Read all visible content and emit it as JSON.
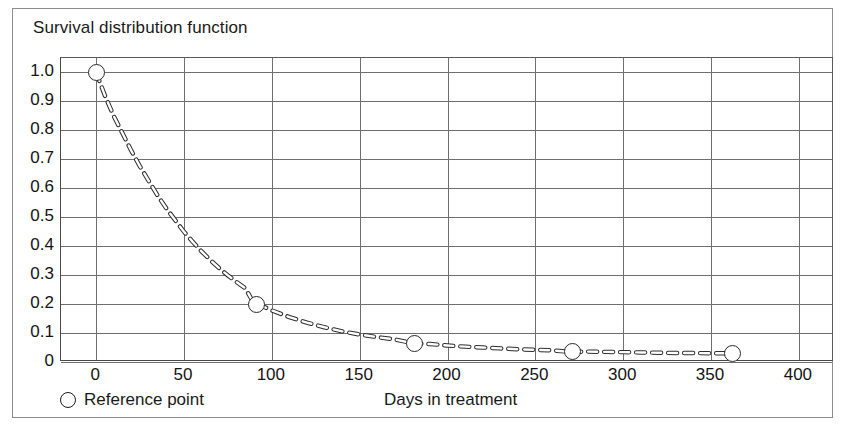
{
  "chart": {
    "title": "Survival distribution function",
    "xlabel": "Days in treatment",
    "legend_label": "Reference point",
    "legend_marker": "open-circle-icon"
  },
  "chart_data": {
    "type": "line",
    "title": "Survival distribution function",
    "subtitle": "",
    "xlabel": "Days in treatment",
    "ylabel": "Survival distribution function",
    "xlim": [
      -20,
      420
    ],
    "ylim": [
      0,
      1.05
    ],
    "grid": true,
    "legend_position": "below-left",
    "xticks": [
      0,
      50,
      100,
      150,
      200,
      250,
      300,
      350,
      400
    ],
    "xticklabels": [
      "0",
      "50",
      "100",
      "150",
      "200",
      "250",
      "300",
      "350",
      "400"
    ],
    "yticks": [
      0,
      0.1,
      0.2,
      0.3,
      0.4,
      0.5,
      0.6,
      0.7,
      0.8,
      0.9,
      1.0
    ],
    "yticklabels": [
      "0",
      "0.1",
      "0.2",
      "0.3",
      "0.4",
      "0.5",
      "0.6",
      "0.7",
      "0.8",
      "0.9",
      "1.0"
    ],
    "series": [
      {
        "name": "Survival curve",
        "style": "dashed",
        "x": [
          0,
          5,
          10,
          15,
          20,
          25,
          30,
          35,
          40,
          45,
          50,
          55,
          60,
          65,
          70,
          75,
          80,
          85,
          90,
          95,
          100,
          110,
          120,
          130,
          140,
          150,
          160,
          170,
          180,
          190,
          200,
          210,
          220,
          230,
          240,
          250,
          260,
          270,
          280,
          290,
          300,
          310,
          320,
          330,
          340,
          350,
          362
        ],
        "y": [
          1.0,
          0.92,
          0.85,
          0.79,
          0.73,
          0.675,
          0.625,
          0.575,
          0.53,
          0.49,
          0.45,
          0.415,
          0.382,
          0.352,
          0.324,
          0.299,
          0.276,
          0.254,
          0.2,
          0.192,
          0.178,
          0.155,
          0.136,
          0.12,
          0.106,
          0.095,
          0.086,
          0.078,
          0.065,
          0.062,
          0.057,
          0.053,
          0.05,
          0.047,
          0.044,
          0.042,
          0.04,
          0.035,
          0.036,
          0.035,
          0.034,
          0.033,
          0.032,
          0.031,
          0.031,
          0.03,
          0.03
        ]
      },
      {
        "name": "Reference point",
        "style": "open-circle-markers",
        "x": [
          0,
          91,
          181,
          271,
          362
        ],
        "y": [
          1.0,
          0.2,
          0.065,
          0.035,
          0.03
        ]
      }
    ]
  }
}
